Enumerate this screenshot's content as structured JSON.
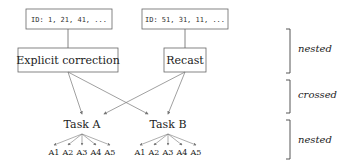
{
  "diagram": {
    "id_boxes": [
      {
        "label": "ID: 1, 21, 41, ..."
      },
      {
        "label": "ID: 51, 31, 11, ..."
      }
    ],
    "conditions": [
      {
        "label": "Explicit correction"
      },
      {
        "label": "Recast"
      }
    ],
    "tasks": [
      {
        "label": "Task A",
        "leaves": [
          "A1",
          "A2",
          "A3",
          "A4",
          "A5"
        ]
      },
      {
        "label": "Task B",
        "leaves": [
          "A1",
          "A2",
          "A3",
          "A4",
          "A5"
        ]
      }
    ],
    "brackets": [
      {
        "label": "nested"
      },
      {
        "label": "crossed"
      },
      {
        "label": "nested"
      }
    ],
    "colors": {
      "line": "#666666",
      "box": "#555555",
      "text": "#222222"
    }
  }
}
